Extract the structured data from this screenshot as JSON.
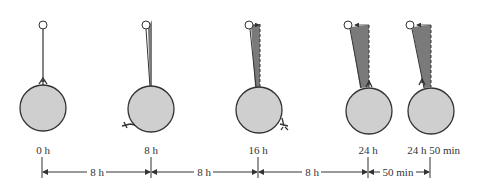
{
  "figure": {
    "colors": {
      "planet_fill": "#cfcfcf",
      "wedge_fill": "#7a7a7a",
      "stroke": "#333333"
    },
    "panels": [
      {
        "time_label": "0 h"
      },
      {
        "time_label": "8 h"
      },
      {
        "time_label": "16 h"
      },
      {
        "time_label": "24 h"
      },
      {
        "time_label": "24 h 50 min"
      }
    ],
    "intervals": [
      {
        "label": "8 h"
      },
      {
        "label": "8 h"
      },
      {
        "label": "8 h"
      },
      {
        "label": "50 min"
      }
    ]
  }
}
